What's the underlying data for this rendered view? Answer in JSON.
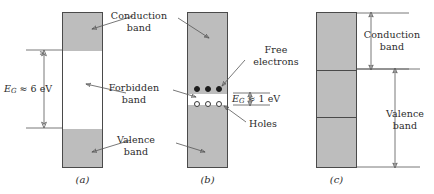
{
  "figure": {
    "colors": {
      "band_fill": "#bdbdbd",
      "outline": "#4a4a4a",
      "leader": "#555555",
      "electron": "#1c1c1c",
      "hole_outline": "#3a3a3a",
      "background": "#ffffff"
    }
  },
  "panels": [
    {
      "id": "a",
      "caption": "(a)",
      "gap_label": {
        "symbol": "E",
        "subscript": "G",
        "relation": "≈",
        "value": "6 eV",
        "full": "E_G ≈ 6 eV"
      },
      "labels": {
        "conduction": "Conduction\nband",
        "conduction_line1": "Conduction",
        "conduction_line2": "band",
        "forbidden_line1": "Forbidden",
        "forbidden_line2": "band",
        "valence_line1": "Valence",
        "valence_line2": "band"
      }
    },
    {
      "id": "b",
      "caption": "(b)",
      "gap_label": {
        "symbol": "E",
        "subscript": "G",
        "relation": "≈",
        "value": "1 eV",
        "full": "E_G ≈ 1 eV"
      },
      "labels": {
        "free_electrons_line1": "Free",
        "free_electrons_line2": "electrons",
        "holes": "Holes"
      },
      "carriers": {
        "electrons_count": 3,
        "holes_count": 3
      }
    },
    {
      "id": "c",
      "caption": "(c)",
      "labels": {
        "conduction_line1": "Conduction",
        "conduction_line2": "band",
        "valence_line1": "Valence",
        "valence_line2": "band"
      }
    }
  ],
  "shared_labels": {
    "conduction_line1": "Conduction",
    "conduction_line2": "band",
    "forbidden_line1": "Forbidden",
    "forbidden_line2": "band",
    "valence_line1": "Valence",
    "valence_line2": "band",
    "free_line1": "Free",
    "free_line2": "electrons",
    "holes": "Holes"
  },
  "captions": {
    "a": "(a)",
    "b": "(b)",
    "c": "(c)"
  }
}
